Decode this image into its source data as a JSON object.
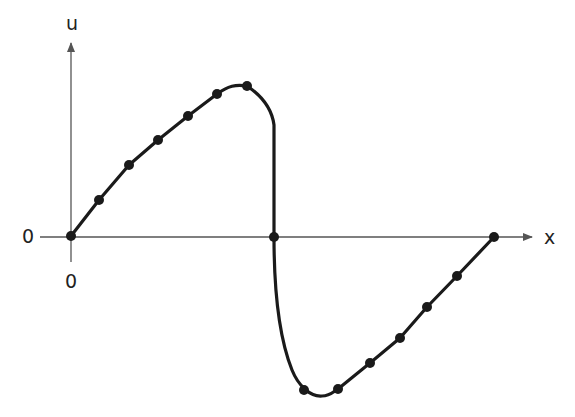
{
  "diagram": {
    "type": "shock-wave profile sketch",
    "axes": {
      "x_label": "x",
      "y_label": "u",
      "x_origin_label": "0",
      "y_origin_label": "0"
    },
    "colors": {
      "curve": "#1a1a1a",
      "axis": "#555555",
      "point": "#1a1a1a",
      "background": "#ffffff"
    },
    "points_px": [
      [
        71,
        236
      ],
      [
        99,
        200
      ],
      [
        129,
        165
      ],
      [
        158,
        140
      ],
      [
        188,
        116
      ],
      [
        217,
        94
      ],
      [
        247,
        86
      ],
      [
        274,
        237
      ],
      [
        304,
        390
      ],
      [
        338,
        389
      ],
      [
        370,
        363
      ],
      [
        400,
        338
      ],
      [
        427,
        307
      ],
      [
        457,
        276
      ],
      [
        494,
        237
      ]
    ]
  }
}
